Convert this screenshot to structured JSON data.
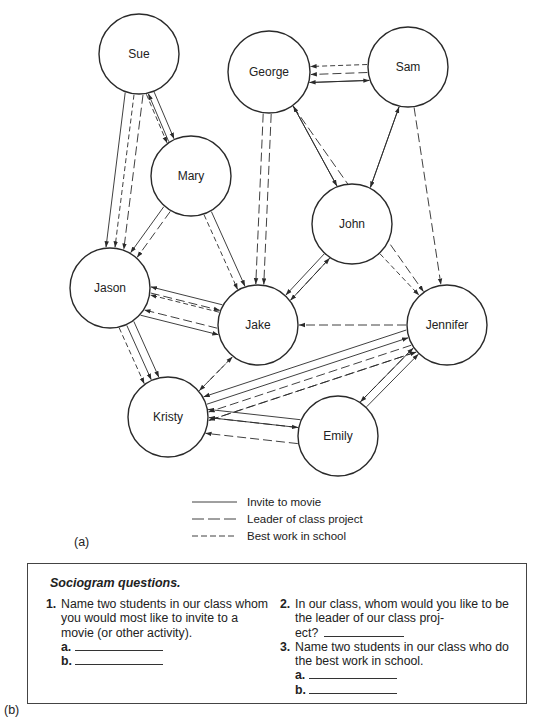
{
  "diagram": {
    "nodes": [
      {
        "id": "sue",
        "label": "Sue",
        "cx": 139,
        "cy": 54,
        "r": 40
      },
      {
        "id": "george",
        "label": "George",
        "cx": 269,
        "cy": 72,
        "r": 41
      },
      {
        "id": "sam",
        "label": "Sam",
        "cx": 408,
        "cy": 67,
        "r": 40
      },
      {
        "id": "mary",
        "label": "Mary",
        "cx": 191,
        "cy": 176,
        "r": 40
      },
      {
        "id": "john",
        "label": "John",
        "cx": 352,
        "cy": 224,
        "r": 40
      },
      {
        "id": "jason",
        "label": "Jason",
        "cx": 110,
        "cy": 288,
        "r": 40
      },
      {
        "id": "jake",
        "label": "Jake",
        "cx": 258,
        "cy": 325,
        "r": 40
      },
      {
        "id": "jennifer",
        "label": "Jennifer",
        "cx": 447,
        "cy": 325,
        "r": 40
      },
      {
        "id": "kristy",
        "label": "Kristy",
        "cx": 168,
        "cy": 417,
        "r": 40
      },
      {
        "id": "emily",
        "label": "Emily",
        "cx": 338,
        "cy": 436,
        "r": 40
      }
    ],
    "edges": [
      {
        "from": "sue",
        "to": "jason",
        "type": "leader",
        "offset": -9
      },
      {
        "from": "sue",
        "to": "jason",
        "type": "best",
        "offset": 0
      },
      {
        "from": "sue",
        "to": "jason",
        "type": "movie",
        "offset": 9
      },
      {
        "from": "mary",
        "to": "sue",
        "type": "movie",
        "offset": -7
      },
      {
        "from": "sue",
        "to": "mary",
        "type": "movie",
        "offset": 1
      },
      {
        "from": "sue",
        "to": "mary",
        "type": "best",
        "offset": 9
      },
      {
        "from": "mary",
        "to": "jason",
        "type": "leader",
        "offset": -4
      },
      {
        "from": "mary",
        "to": "jason",
        "type": "movie",
        "offset": 4
      },
      {
        "from": "mary",
        "to": "jake",
        "type": "movie",
        "offset": -4
      },
      {
        "from": "mary",
        "to": "jake",
        "type": "best",
        "offset": 4
      },
      {
        "from": "george",
        "to": "jake",
        "type": "leader",
        "offset": -4
      },
      {
        "from": "george",
        "to": "jake",
        "type": "leader",
        "offset": 4
      },
      {
        "from": "sam",
        "to": "george",
        "type": "movie",
        "offset": -12
      },
      {
        "from": "sam",
        "to": "george",
        "type": "leader",
        "offset": -4
      },
      {
        "from": "sam",
        "to": "george",
        "type": "best",
        "offset": 4
      },
      {
        "from": "george",
        "to": "sam",
        "type": "movie",
        "offset": 12
      },
      {
        "from": "george",
        "to": "john",
        "type": "movie",
        "offset": -5
      },
      {
        "from": "john",
        "to": "george",
        "type": "movie",
        "offset": 5
      },
      {
        "from": "sam",
        "to": "john",
        "type": "movie",
        "offset": -5
      },
      {
        "from": "john",
        "to": "sam",
        "type": "movie",
        "offset": 5
      },
      {
        "from": "george",
        "to": "jennifer",
        "type": "leader",
        "offset": 0
      },
      {
        "from": "sam",
        "to": "jennifer",
        "type": "leader",
        "offset": 0
      },
      {
        "from": "john",
        "to": "jennifer",
        "type": "best",
        "offset": 0
      },
      {
        "from": "john",
        "to": "jake",
        "type": "leader",
        "offset": -7
      },
      {
        "from": "john",
        "to": "jake",
        "type": "movie",
        "offset": 0
      },
      {
        "from": "jake",
        "to": "john",
        "type": "movie",
        "offset": 7
      },
      {
        "from": "jake",
        "to": "jason",
        "type": "leader",
        "offset": -13
      },
      {
        "from": "jason",
        "to": "jake",
        "type": "leader",
        "offset": -5
      },
      {
        "from": "jake",
        "to": "jason",
        "type": "best",
        "offset": 3
      },
      {
        "from": "jake",
        "to": "jason",
        "type": "movie",
        "offset": 11
      },
      {
        "from": "jason",
        "to": "jake",
        "type": "movie",
        "offset": 19
      },
      {
        "from": "jason",
        "to": "kristy",
        "type": "movie",
        "offset": -8
      },
      {
        "from": "jason",
        "to": "kristy",
        "type": "movie",
        "offset": 0
      },
      {
        "from": "jason",
        "to": "kristy",
        "type": "best",
        "offset": 8
      },
      {
        "from": "jake",
        "to": "kristy",
        "type": "leader",
        "offset": -4
      },
      {
        "from": "kristy",
        "to": "jake",
        "type": "best",
        "offset": 4
      },
      {
        "from": "jennifer",
        "to": "jake",
        "type": "leader",
        "offset": 0
      },
      {
        "from": "jennifer",
        "to": "kristy",
        "type": "leader",
        "offset": -16
      },
      {
        "from": "jennifer",
        "to": "kristy",
        "type": "leader",
        "offset": -8
      },
      {
        "from": "kristy",
        "to": "jennifer",
        "type": "movie",
        "offset": 0
      },
      {
        "from": "jennifer",
        "to": "kristy",
        "type": "movie",
        "offset": 8
      },
      {
        "from": "kristy",
        "to": "jennifer",
        "type": "leader",
        "offset": 16
      },
      {
        "from": "emily",
        "to": "kristy",
        "type": "leader",
        "offset": -12
      },
      {
        "from": "kristy",
        "to": "emily",
        "type": "movie",
        "offset": -4
      },
      {
        "from": "emily",
        "to": "kristy",
        "type": "leader",
        "offset": 4
      },
      {
        "from": "emily",
        "to": "kristy",
        "type": "movie",
        "offset": 12
      },
      {
        "from": "emily",
        "to": "jennifer",
        "type": "leader",
        "offset": -8
      },
      {
        "from": "emily",
        "to": "jennifer",
        "type": "movie",
        "offset": 0
      },
      {
        "from": "jennifer",
        "to": "emily",
        "type": "movie",
        "offset": 8
      }
    ],
    "legend": [
      {
        "type": "movie",
        "label": "Invite to movie"
      },
      {
        "type": "leader",
        "label": "Leader of class project"
      },
      {
        "type": "best",
        "label": "Best work in school"
      }
    ],
    "panel_label": "(a)"
  },
  "questions": {
    "panel_label": "(b)",
    "title": "Sociogram questions.",
    "items": [
      {
        "num": "1.",
        "text": "Name two students in our class whom you would most like to invite to a movie (or other activity).",
        "blanks": [
          "a.",
          "b."
        ]
      },
      {
        "num": "2.",
        "text": "In our class, whom would you like to be the leader of our class proj-",
        "text_cont": "ect?"
      },
      {
        "num": "3.",
        "text": "Name two students in our class who do the best work in school.",
        "blanks": [
          "a.",
          "b."
        ]
      }
    ]
  },
  "styles": {
    "stroke": "#2a2a2a"
  }
}
